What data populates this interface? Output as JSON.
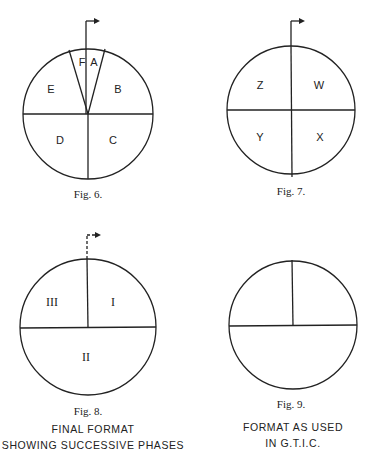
{
  "figures": [
    {
      "caption": "Fig. 6.",
      "segments": [
        "A",
        "B",
        "C",
        "D",
        "E",
        "F"
      ],
      "arrow": "solid"
    },
    {
      "caption": "Fig. 7.",
      "segments": [
        "W",
        "X",
        "Y",
        "Z"
      ],
      "arrow": "solid"
    },
    {
      "caption": "Fig. 8.",
      "segments": [
        "I",
        "II",
        "III"
      ],
      "arrow": "dashed",
      "note_lines": [
        "FINAL  FORMAT",
        "SHOWING SUCCESSIVE PHASES"
      ]
    },
    {
      "caption": "Fig. 9.",
      "segments": [],
      "arrow": "none",
      "note_lines": [
        "FORMAT AS USED",
        "IN G.T.I.C."
      ]
    }
  ],
  "colors": {
    "ink": "#222222",
    "background": "#ffffff"
  }
}
